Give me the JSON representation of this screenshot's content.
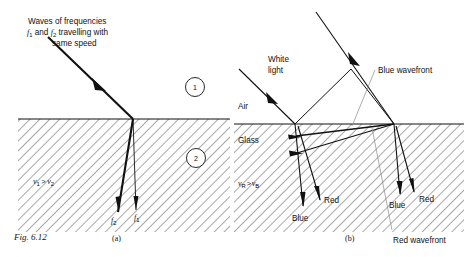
{
  "figure": {
    "caption": "Fig. 6.12",
    "panels": [
      {
        "key": "a",
        "label": "(a)"
      },
      {
        "key": "b",
        "label": "(b)"
      }
    ]
  },
  "panel_a": {
    "incident_caption_line1": "Waves of frequencies",
    "incident_caption_line2_pre": "f",
    "incident_caption_line2_sub1": "1",
    "incident_caption_line2_mid": " and ",
    "incident_caption_line2_f2": "f",
    "incident_caption_line2_sub2": "2",
    "incident_caption_line2_post": " travelling with",
    "incident_caption_line3": "same speed",
    "medium_1_label": "1",
    "medium_2_label": "2",
    "speed_relation": {
      "v": "v",
      "sub_left": "1",
      "gt": ">",
      "v2": "v",
      "sub_right": "2"
    },
    "ray_label_left": {
      "sym": "f",
      "sub": "2"
    },
    "ray_label_right": {
      "sym": "f",
      "sub": "1"
    }
  },
  "panel_b": {
    "white_light_line1": "White",
    "white_light_line2": "light",
    "air_label": "Air",
    "glass_label": "Glass",
    "blue_wavefront_label": "Blue wavefront",
    "red_wavefront_label": "Red wavefront",
    "speed_relation": {
      "v": "v",
      "sub_left": "R",
      "gt": ">",
      "v2": "v",
      "sub_right": "B"
    },
    "ray_labels_left": {
      "blue": "Blue",
      "red": "Red"
    },
    "ray_labels_right": {
      "blue": "Blue",
      "red": "Red"
    }
  },
  "colors": {
    "ink": "#111111",
    "hatch": "#333333",
    "background": "#ffffff",
    "leader": "#777777"
  }
}
